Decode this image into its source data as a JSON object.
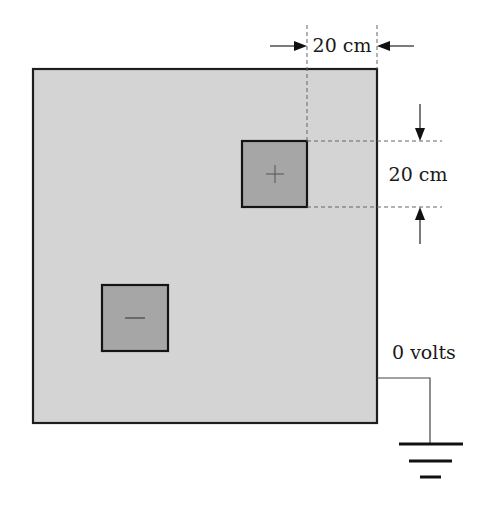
{
  "diagram": {
    "type": "electrostatics-figure",
    "background_color": "#ffffff",
    "sheet": {
      "fill": "#d4d4d4",
      "stroke": "#1e1e1e",
      "x": 33,
      "y": 69,
      "width": 344,
      "height": 354
    },
    "plates": [
      {
        "name": "positive-plate",
        "sign": "+",
        "fill": "#a6a6a6",
        "x": 242,
        "y": 141,
        "size": 65
      },
      {
        "name": "negative-plate",
        "sign": "−",
        "fill": "#a6a6a6",
        "x": 102,
        "y": 285,
        "size": 66
      }
    ],
    "dimensions": {
      "horizontal": {
        "label": "20 cm"
      },
      "vertical": {
        "label": "20 cm"
      }
    },
    "ground": {
      "label": "0 volts",
      "icon": "ground-icon"
    }
  }
}
